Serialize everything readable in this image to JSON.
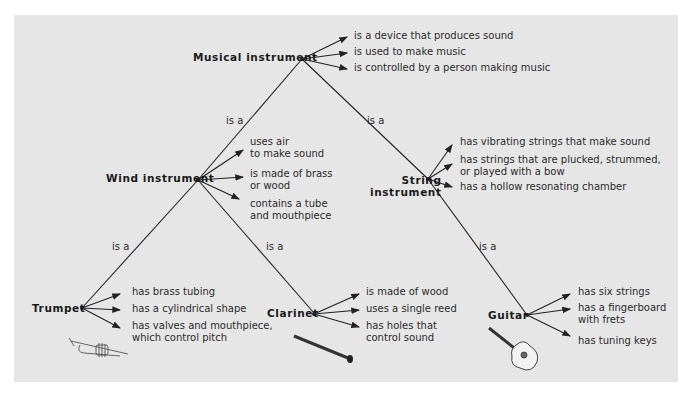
{
  "diagram": {
    "relation_label": "is a",
    "root": {
      "label": "Musical instrument",
      "attributes": [
        "is a device that produces sound",
        "is used to make music",
        "is controlled by a person making music"
      ]
    },
    "wind": {
      "label": "Wind instrument",
      "attributes": [
        "uses air\nto make sound",
        "is made of brass\nor wood",
        "contains a tube\nand mouthpiece"
      ]
    },
    "string": {
      "label": "String\ninstrument",
      "attributes": [
        "has vibrating strings that make sound",
        "has strings that are plucked, strummed,\nor played with a bow",
        "has a hollow resonating chamber"
      ]
    },
    "trumpet": {
      "label": "Trumpet",
      "icon": "trumpet-icon",
      "attributes": [
        "has brass tubing",
        "has a cylindrical shape",
        "has valves and mouthpiece,\nwhich control pitch"
      ]
    },
    "clarinet": {
      "label": "Clarinet",
      "icon": "clarinet-icon",
      "attributes": [
        "is made of wood",
        "uses a single reed",
        "has holes that\ncontrol sound"
      ]
    },
    "guitar": {
      "label": "Guitar",
      "icon": "guitar-icon",
      "attributes": [
        "has six strings",
        "has a fingerboard\nwith frets",
        "has tuning keys"
      ]
    },
    "colors": {
      "background": "#e6e6e6",
      "line": "#222222",
      "text": "#2a2a2a"
    }
  }
}
